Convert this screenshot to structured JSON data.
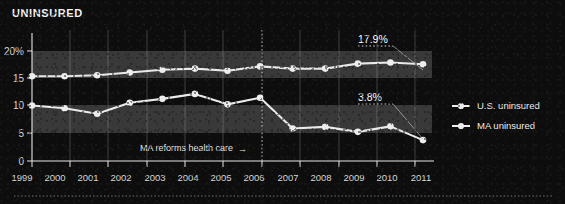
{
  "chart_data": {
    "type": "line",
    "title": "UNINSURED",
    "xlabel": "",
    "ylabel": "",
    "x": [
      1999,
      2000,
      2001,
      2002,
      2003,
      2004,
      2005,
      2006,
      2007,
      2008,
      2009,
      2010,
      2011
    ],
    "categories": [
      "1999",
      "2000",
      "2001",
      "2002",
      "2003",
      "2004",
      "2005",
      "2006",
      "2007",
      "2008",
      "2009",
      "2010",
      "2011"
    ],
    "ylim": [
      0,
      22
    ],
    "yticks": [
      0,
      5,
      10,
      15,
      20
    ],
    "ytick_labels": [
      "0",
      "5",
      "10",
      "15",
      "20%"
    ],
    "grid": true,
    "legend_position": "right",
    "series": [
      {
        "name": "U.S. uninsured",
        "color": "#ededed",
        "values": [
          15.4,
          15.4,
          15.6,
          16.1,
          16.6,
          16.8,
          16.4,
          17.2,
          16.8,
          16.8,
          17.7,
          17.9,
          17.6
        ]
      },
      {
        "name": "MA uninsured",
        "color": "#ededed",
        "values": [
          10.1,
          9.6,
          8.6,
          10.6,
          11.3,
          12.2,
          10.3,
          11.5,
          5.9,
          6.2,
          5.3,
          6.3,
          3.8
        ]
      }
    ],
    "annotations": [
      {
        "text": "17.9%",
        "target_year": 2011,
        "target_series": "U.S. uninsured"
      },
      {
        "text": "3.8%",
        "target_year": 2011,
        "target_series": "MA uninsured"
      },
      {
        "text": "MA reforms health care",
        "marker_year": 2006,
        "arrow": "→"
      }
    ]
  },
  "legend": {
    "items": [
      {
        "label": "U.S. uninsured"
      },
      {
        "label": "MA uninsured"
      }
    ]
  }
}
